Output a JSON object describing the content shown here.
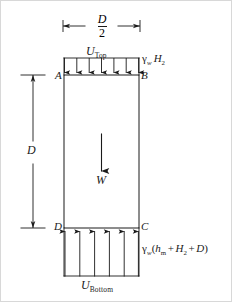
{
  "figure": {
    "background_color": "#ffffff",
    "line_color": "#1a1a1a",
    "border_color": "#d8d8d8"
  },
  "dimensions": {
    "top": {
      "name": "width-dimension",
      "numerator": "D",
      "denominator": "2",
      "label": "D/2"
    },
    "left": {
      "name": "depth-dimension",
      "label": "D"
    }
  },
  "block": {
    "corners": {
      "top_left": "A",
      "top_right": "B",
      "bottom_right": "C",
      "bottom_left": "D"
    },
    "weight": {
      "label": "W",
      "direction": "down"
    }
  },
  "pressures": {
    "top": {
      "resultant_label": "U",
      "resultant_subscript": "Top",
      "intensity_symbol": "γ",
      "intensity_subscript": "w",
      "intensity_term": "H",
      "intensity_term_subscript": "2",
      "intensity_label": "γw H2",
      "arrow_count": 7,
      "direction": "down"
    },
    "bottom": {
      "resultant_label": "U",
      "resultant_subscript": "Bottom",
      "intensity_symbol": "γ",
      "intensity_subscript": "w",
      "intensity_open": "(",
      "intensity_term1": "h",
      "intensity_term1_subscript": "m",
      "intensity_plus1": "+",
      "intensity_term2": "H",
      "intensity_term2_subscript": "2",
      "intensity_plus2": "+",
      "intensity_term3": "D",
      "intensity_close": ")",
      "intensity_label": "γw(hm + H2 + D)",
      "arrow_count": 6,
      "direction": "up"
    }
  }
}
